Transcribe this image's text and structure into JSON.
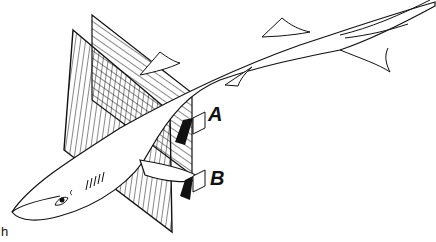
{
  "figure": {
    "labels": {
      "a": "A",
      "b": "B",
      "corner": "h"
    },
    "colors": {
      "ink": "#111111",
      "background": "#ffffff"
    }
  }
}
